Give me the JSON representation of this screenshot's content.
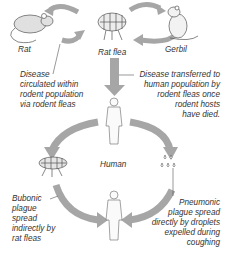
{
  "colors": {
    "arrow": "#a6a6a6",
    "outline": "#666666",
    "text": "#333333",
    "background": "#ffffff"
  },
  "nodes": {
    "rat": {
      "label": "Rat",
      "icon": "rat-icon"
    },
    "rat_flea": {
      "label": "Rat flea",
      "icon": "flea-icon"
    },
    "gerbil": {
      "label": "Gerbil",
      "icon": "gerbil-icon"
    },
    "human": {
      "label": "Human",
      "icon": "human-figure-icon"
    },
    "flea_vector": {
      "icon": "flea-icon"
    },
    "droplets": {
      "icon": "droplets-icon"
    }
  },
  "annotations": {
    "rodent_circulation": [
      "Disease",
      "circulated within",
      "rodent population",
      "via rodent fleas"
    ],
    "transfer_to_human": [
      "Disease transferred to",
      "human population by",
      "rodent fleas once",
      "rodent hosts",
      "have died."
    ],
    "bubonic": [
      "Bubonic",
      "plague",
      "spread",
      "indirectly by",
      "rat fleas"
    ],
    "pneumonic": [
      "Pneumonic",
      "plague spread",
      "directly by droplets",
      "expelled during",
      "coughing"
    ]
  }
}
